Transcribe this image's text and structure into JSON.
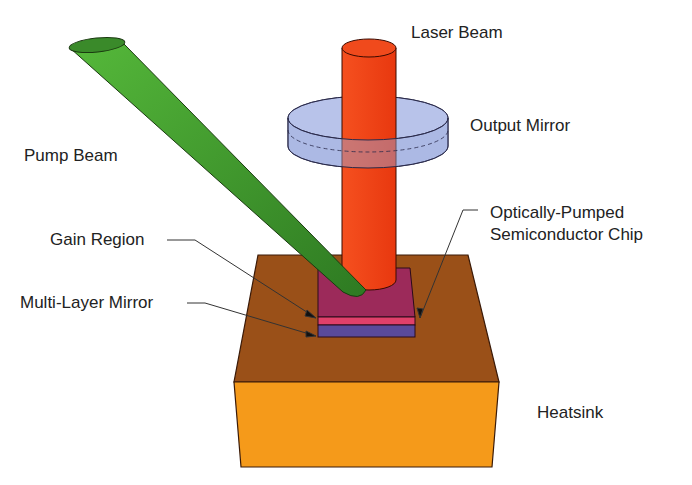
{
  "diagram": {
    "labels": {
      "laser_beam": "Laser Beam",
      "output_mirror": "Output Mirror",
      "pump_beam": "Pump Beam",
      "gain_region": "Gain Region",
      "chip_line1": "Optically-Pumped",
      "chip_line2": "Semiconductor Chip",
      "multi_layer_mirror": "Multi-Layer Mirror",
      "heatsink": "Heatsink"
    },
    "colors": {
      "laser_beam": "#f2401a",
      "output_mirror": "#9fb0e0",
      "pump_beam": "#3f9a2e",
      "gain_region": "#9c2a5a",
      "gain_stripe": "#e0406a",
      "mirror_layer": "#5a4a9a",
      "heatsink_top": "#9a5018",
      "heatsink_front": "#f59a1a"
    }
  }
}
